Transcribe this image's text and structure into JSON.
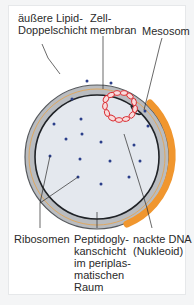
{
  "figure": {
    "labels": {
      "outer_membrane": "äußere Lipid-\nDoppelschicht",
      "cell_membrane": "Zell-\nmembran",
      "mesosome": "Mesosom",
      "ribosomes": "Ribosomen",
      "peptidoglycan": "Peptidogly-\nkanschicht\nim periplas-\nmatischen\nRaum",
      "dna": "nackte DNA\n(Nukleoid)"
    },
    "colors": {
      "cytoplasm": "#e4e8ee",
      "periplasm": "#b9bcc0",
      "outer_ring": "#8c8f93",
      "orange": "#f0962e",
      "dna": "#d9262c",
      "ribosome": "#2b3f8a"
    }
  }
}
